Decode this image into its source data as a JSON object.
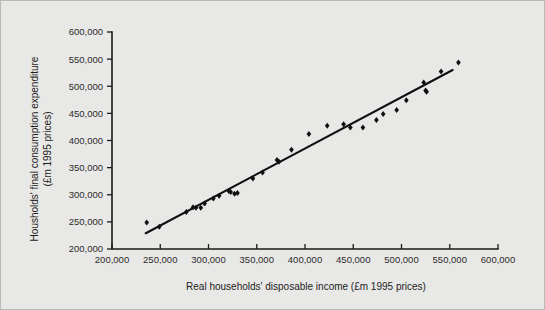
{
  "chart_data": {
    "type": "scatter",
    "title": "",
    "xlabel": "Real households' disposable income (£m 1995 prices)",
    "ylabel": "Housholds' final consumption expenditure (£m 1995 prices)",
    "ylabel_line1": "Housholds' final consumption expenditure",
    "ylabel_line2": "(£m 1995 prices)",
    "xlim": [
      200000,
      600000
    ],
    "ylim": [
      200000,
      600000
    ],
    "xticks": [
      200000,
      250000,
      300000,
      350000,
      400000,
      450000,
      500000,
      550000,
      600000
    ],
    "yticks": [
      200000,
      250000,
      300000,
      350000,
      400000,
      450000,
      500000,
      550000,
      600000
    ],
    "xtick_labels": [
      "200,000",
      "250,000",
      "300,000",
      "350,000",
      "400,000",
      "450,000",
      "500,000",
      "550,000",
      "600,000"
    ],
    "ytick_labels": [
      "200,000",
      "250,000",
      "300,000",
      "350,000",
      "400,000",
      "450,000",
      "500,000",
      "550,000",
      "600,000"
    ],
    "grid": false,
    "legend": null,
    "marker_style": "filled-diamond",
    "marker_color": "#101010",
    "line_color": "#101010",
    "series": [
      {
        "name": "Households' consumption vs disposable income",
        "points": [
          [
            236000,
            249000
          ],
          [
            249000,
            241000
          ],
          [
            277000,
            268000
          ],
          [
            284000,
            277000
          ],
          [
            287000,
            276000
          ],
          [
            292000,
            276000
          ],
          [
            296000,
            284000
          ],
          [
            305000,
            293000
          ],
          [
            311000,
            298000
          ],
          [
            321000,
            307000
          ],
          [
            323000,
            305000
          ],
          [
            327000,
            302000
          ],
          [
            330000,
            303000
          ],
          [
            346000,
            330000
          ],
          [
            356000,
            341000
          ],
          [
            371000,
            364000
          ],
          [
            373000,
            361000
          ],
          [
            386000,
            383000
          ],
          [
            404000,
            412000
          ],
          [
            423000,
            427000
          ],
          [
            440000,
            430000
          ],
          [
            447000,
            424000
          ],
          [
            460000,
            424000
          ],
          [
            474000,
            438000
          ],
          [
            481000,
            449000
          ],
          [
            495000,
            456000
          ],
          [
            505000,
            474000
          ],
          [
            523000,
            507000
          ],
          [
            525000,
            492000
          ],
          [
            526000,
            490000
          ],
          [
            541000,
            527000
          ],
          [
            559000,
            544000
          ]
        ]
      }
    ],
    "trend_line": {
      "name": "linear fit",
      "x_start": 235000,
      "y_start": 229000,
      "x_end": 553000,
      "y_end": 530000
    }
  }
}
